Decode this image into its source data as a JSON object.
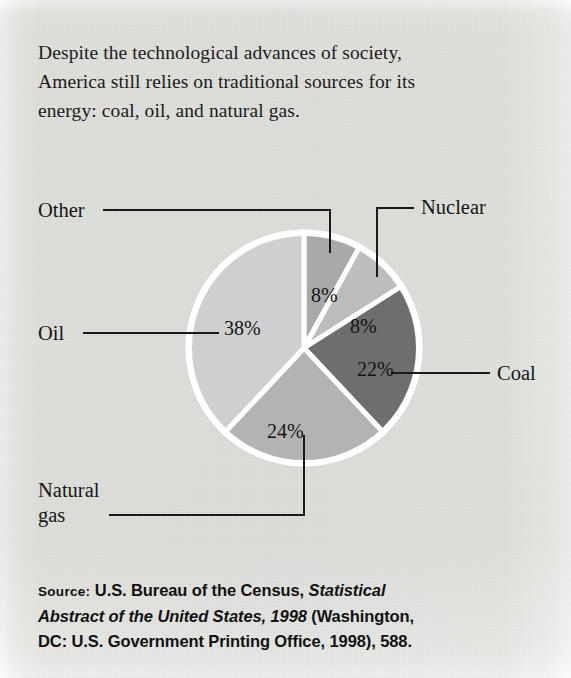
{
  "caption": {
    "lines": [
      "Despite the technological advances of society,",
      "America still relies on traditional sources for its",
      "energy: coal, oil, and natural gas."
    ]
  },
  "chart_data": {
    "type": "pie",
    "title": "",
    "xlabel": "",
    "ylabel": "",
    "legend_position": "leader-labels",
    "grid": false,
    "units": "percent",
    "start_angle_deg": 0,
    "direction": "clockwise",
    "categories": [
      "Other",
      "Nuclear",
      "Coal",
      "Natural gas",
      "Oil"
    ],
    "values": [
      8,
      8,
      22,
      24,
      38
    ],
    "slices": [
      {
        "label": "Other",
        "value": 8,
        "value_text": "8%",
        "color": "#a9a9a9"
      },
      {
        "label": "Nuclear",
        "value": 8,
        "value_text": "8%",
        "color": "#bdbdbd"
      },
      {
        "label": "Coal",
        "value": 22,
        "value_text": "22%",
        "color": "#6e6e6e"
      },
      {
        "label": "Natural gas",
        "value": 24,
        "value_text": "24%",
        "color": "#b3b3b3"
      },
      {
        "label": "Oil",
        "value": 38,
        "value_text": "38%",
        "color": "#cfcfcf"
      }
    ]
  },
  "labels": {
    "other": "Other",
    "nuclear": "Nuclear",
    "coal": "Coal",
    "oil": "Oil",
    "natural_gas_line1": "Natural",
    "natural_gas_line2": "gas"
  },
  "percent_labels": {
    "other": "8%",
    "nuclear": "8%",
    "coal": "22%",
    "natural_gas": "24%",
    "oil": "38%"
  },
  "source": {
    "prefix": "Source:",
    "line1_rest": " U.S. Bureau of the Census, ",
    "title_part1": "Statistical",
    "title_part2": "Abstract of the United States, 1998",
    "line2_rest": " (Washington,",
    "line3": "DC: U.S. Government Printing Office, 1998), 588."
  },
  "colors": {
    "paper": "#eeeeec",
    "ink": "#151515",
    "slice_gap": "#ffffff"
  }
}
